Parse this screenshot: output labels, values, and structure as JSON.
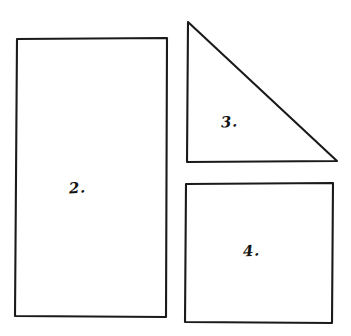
{
  "page": {
    "background_color": "#ffffff",
    "ink_color": "#1a1a1a",
    "width": 351,
    "height": 336
  },
  "shapes": [
    {
      "id": "rectangle-2",
      "label": "2.",
      "kind": "rectangle",
      "label_x": 69,
      "label_y": 179,
      "points": "17,39 167,38 166,317 15,316",
      "stroke": "#1a1a1a"
    },
    {
      "id": "triangle-3",
      "label": "3.",
      "kind": "right-triangle",
      "label_x": 221,
      "label_y": 113,
      "points": "188,22 337,161 187,162",
      "stroke": "#1a1a1a"
    },
    {
      "id": "square-4",
      "label": "4.",
      "kind": "square",
      "label_x": 243,
      "label_y": 242,
      "points": "186,184 333,183 332,323 185,322",
      "stroke": "#1a1a1a"
    }
  ]
}
